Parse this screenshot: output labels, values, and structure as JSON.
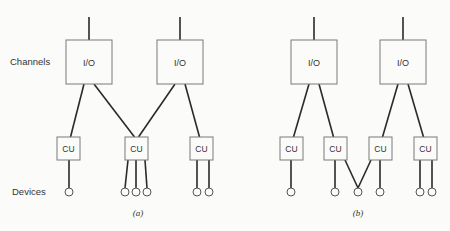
{
  "labels": {
    "channels": "Channels",
    "devices": "Devices"
  },
  "diagrams": [
    {
      "caption": "(a)",
      "caption_pos": [
        138,
        216
      ],
      "channels": [
        {
          "label": "I/O",
          "x": 66,
          "y": 40,
          "w": 46,
          "h": 44
        },
        {
          "label": "I/O",
          "x": 157,
          "y": 40,
          "w": 46,
          "h": 44
        }
      ],
      "control_units": [
        {
          "label": "CU",
          "x": 57,
          "y": 137,
          "w": 23,
          "h": 23
        },
        {
          "label": "CU",
          "x": 125,
          "y": 137,
          "w": 23,
          "h": 23
        },
        {
          "label": "CU",
          "x": 190,
          "y": 137,
          "w": 23,
          "h": 23
        }
      ],
      "channel_to_cu": [
        [
          0,
          0
        ],
        [
          0,
          1
        ],
        [
          1,
          1
        ],
        [
          1,
          2
        ]
      ],
      "devices": [
        {
          "x": 69,
          "y": 192,
          "cu": [
            0
          ]
        },
        {
          "x": 125,
          "y": 192,
          "cu": [
            1
          ]
        },
        {
          "x": 136,
          "y": 192,
          "cu": [
            1
          ]
        },
        {
          "x": 147,
          "y": 192,
          "cu": [
            1
          ]
        },
        {
          "x": 197,
          "y": 192,
          "cu": [
            2
          ]
        },
        {
          "x": 209,
          "y": 192,
          "cu": [
            2
          ]
        }
      ]
    },
    {
      "caption": "(b)",
      "caption_pos": [
        358,
        216
      ],
      "channels": [
        {
          "label": "I/O",
          "x": 291,
          "y": 40,
          "w": 46,
          "h": 44
        },
        {
          "label": "I/O",
          "x": 380,
          "y": 40,
          "w": 46,
          "h": 44
        }
      ],
      "control_units": [
        {
          "label": "CU",
          "x": 280,
          "y": 137,
          "w": 23,
          "h": 23
        },
        {
          "label": "CU",
          "x": 324,
          "y": 137,
          "w": 23,
          "h": 23
        },
        {
          "label": "CU",
          "x": 369,
          "y": 137,
          "w": 23,
          "h": 23
        },
        {
          "label": "CU",
          "x": 414,
          "y": 137,
          "w": 23,
          "h": 23
        }
      ],
      "channel_to_cu": [
        [
          0,
          0
        ],
        [
          0,
          1
        ],
        [
          1,
          2
        ],
        [
          1,
          3
        ]
      ],
      "devices": [
        {
          "x": 291,
          "y": 192,
          "cu": [
            0
          ]
        },
        {
          "x": 335,
          "y": 192,
          "cu": [
            1
          ]
        },
        {
          "x": 358,
          "y": 192,
          "cu": [
            1,
            2
          ]
        },
        {
          "x": 380,
          "y": 192,
          "cu": [
            2
          ]
        },
        {
          "x": 420,
          "y": 192,
          "cu": [
            3
          ]
        },
        {
          "x": 432,
          "y": 192,
          "cu": [
            3
          ]
        }
      ]
    }
  ]
}
